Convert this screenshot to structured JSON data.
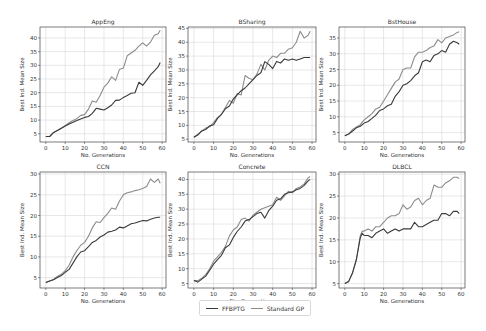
{
  "figure": {
    "legend": [
      {
        "label": "FFBPTG",
        "color": "#3a3a3a"
      },
      {
        "label": "Standard GP",
        "color": "#8c8c8c"
      }
    ]
  },
  "chart_data": [
    {
      "type": "line",
      "title": "AppEng",
      "xlabel": "No. Generations",
      "ylabel": "Best Ind. Mean Size",
      "xlim": [
        -3,
        62
      ],
      "ylim": [
        2,
        44
      ],
      "xticks": [
        0,
        10,
        20,
        30,
        40,
        50,
        60
      ],
      "yticks": [
        5,
        10,
        15,
        20,
        25,
        30,
        35,
        40
      ],
      "grid": true,
      "x": [
        0,
        2,
        4,
        6,
        8,
        10,
        12,
        14,
        16,
        18,
        20,
        22,
        24,
        26,
        28,
        30,
        32,
        34,
        36,
        38,
        40,
        42,
        44,
        46,
        48,
        50,
        52,
        54,
        56,
        58,
        59
      ],
      "series": [
        {
          "name": "FFBPTG",
          "values": [
            4,
            4,
            5.5,
            6.2,
            7,
            7.8,
            8.6,
            9.2,
            9.8,
            10.4,
            11,
            11.3,
            12.5,
            14.3,
            14,
            13.7,
            14.5,
            15.5,
            17.2,
            17.3,
            18.3,
            19,
            19.8,
            20,
            23.8,
            22.7,
            24.5,
            26.5,
            28,
            29.5,
            31
          ]
        },
        {
          "name": "Standard GP",
          "values": [
            4,
            4,
            5.5,
            6.2,
            7,
            8,
            9,
            9.8,
            10.5,
            11.7,
            12,
            14,
            17,
            16.5,
            19,
            22,
            23.5,
            25.8,
            24.5,
            28.5,
            29,
            33.5,
            34.5,
            35.5,
            37,
            38.2,
            37,
            38.5,
            41,
            41.5,
            42.8
          ]
        }
      ]
    },
    {
      "type": "line",
      "title": "BSharing",
      "xlabel": "No. Generations",
      "ylabel": "Best Ind. Mean Size",
      "xlim": [
        -3,
        62
      ],
      "ylim": [
        4,
        45.5
      ],
      "xticks": [
        0,
        10,
        20,
        30,
        40,
        50,
        60
      ],
      "yticks": [
        5,
        10,
        15,
        20,
        25,
        30,
        35,
        40,
        45
      ],
      "grid": true,
      "x": [
        0,
        2,
        4,
        6,
        8,
        10,
        12,
        14,
        16,
        18,
        20,
        22,
        24,
        26,
        28,
        30,
        32,
        34,
        36,
        38,
        40,
        42,
        44,
        46,
        48,
        50,
        52,
        54,
        56,
        58,
        59
      ],
      "series": [
        {
          "name": "FFBPTG",
          "values": [
            5.7,
            6.5,
            8,
            8.5,
            9.8,
            10.2,
            12.5,
            14,
            16,
            17,
            19.5,
            21,
            22.5,
            23.5,
            25,
            26.5,
            28,
            29,
            33,
            32,
            30.5,
            33,
            32.5,
            34,
            33.5,
            34,
            33.5,
            34,
            34.5,
            34.5,
            34.5
          ]
        },
        {
          "name": "Standard GP",
          "values": [
            5.7,
            6.8,
            8,
            9,
            9.5,
            11,
            12.8,
            14,
            16.5,
            19,
            18,
            21.5,
            21,
            28,
            27,
            26.5,
            28.5,
            32,
            30,
            33.5,
            35,
            34.5,
            36,
            36,
            37.5,
            38,
            40,
            44,
            41.5,
            42.5,
            44
          ]
        }
      ]
    },
    {
      "type": "line",
      "title": "BstHouse",
      "xlabel": "No. Generations",
      "ylabel": "Best Ind. Mean Size",
      "xlim": [
        -3,
        62
      ],
      "ylim": [
        2,
        38.5
      ],
      "xticks": [
        0,
        10,
        20,
        30,
        40,
        50,
        60
      ],
      "yticks": [
        5,
        10,
        15,
        20,
        25,
        30,
        35
      ],
      "grid": true,
      "x": [
        0,
        2,
        4,
        6,
        8,
        10,
        12,
        14,
        16,
        18,
        20,
        22,
        24,
        26,
        28,
        30,
        32,
        34,
        36,
        38,
        40,
        42,
        44,
        46,
        48,
        50,
        52,
        54,
        56,
        58,
        59
      ],
      "series": [
        {
          "name": "FFBPTG",
          "values": [
            4,
            4.5,
            5.5,
            6.5,
            7,
            8,
            8.5,
            9.5,
            10.5,
            12,
            12.5,
            13.5,
            14,
            16.5,
            18,
            20,
            20.5,
            21.5,
            23,
            24,
            27.5,
            28,
            27.5,
            29.5,
            30,
            31,
            30.5,
            33,
            34,
            33.5,
            33
          ]
        },
        {
          "name": "Standard GP",
          "values": [
            4,
            4.5,
            6,
            6.8,
            7.5,
            9,
            10,
            11,
            12.5,
            13,
            15,
            17,
            19,
            21,
            22,
            25,
            25.5,
            25.5,
            29,
            30.5,
            30.5,
            31,
            32,
            32.5,
            34.5,
            33.5,
            35,
            35.5,
            36,
            36.8,
            37
          ]
        }
      ]
    },
    {
      "type": "line",
      "title": "CCN",
      "xlabel": "No. Generations",
      "ylabel": "Best Ind. Mean Size",
      "xlim": [
        -3,
        62
      ],
      "ylim": [
        2.5,
        30.5
      ],
      "xticks": [
        0,
        10,
        20,
        30,
        40,
        50,
        60
      ],
      "yticks": [
        5,
        10,
        15,
        20,
        25,
        30
      ],
      "grid": true,
      "x": [
        0,
        2,
        4,
        6,
        8,
        10,
        12,
        14,
        16,
        18,
        20,
        22,
        24,
        26,
        28,
        30,
        32,
        34,
        36,
        38,
        40,
        42,
        44,
        46,
        48,
        50,
        52,
        54,
        56,
        58,
        59
      ],
      "series": [
        {
          "name": "FFBPTG",
          "values": [
            3.8,
            4.2,
            4.5,
            5,
            5.5,
            6.3,
            7,
            8.5,
            10,
            11.2,
            11.5,
            12.5,
            13.5,
            14,
            14.8,
            15.3,
            16,
            16.2,
            16.5,
            17.2,
            17,
            17.5,
            18,
            18.2,
            18.5,
            18.8,
            18.7,
            19.1,
            19.4,
            19.6,
            19.6
          ]
        },
        {
          "name": "Standard GP",
          "values": [
            3.8,
            4.2,
            4.6,
            5.3,
            5.8,
            6.7,
            8,
            10,
            11.5,
            12.8,
            13.5,
            15,
            17,
            18.5,
            18.3,
            19.5,
            20.5,
            21.8,
            21.5,
            23.5,
            25,
            25.5,
            25.7,
            26,
            26.2,
            26.5,
            27,
            28.8,
            28,
            28.8,
            27.8
          ]
        }
      ]
    },
    {
      "type": "line",
      "title": "Concrete",
      "xlabel": "No. Generations",
      "ylabel": "Best Ind. Mean Size",
      "xlim": [
        -3,
        62
      ],
      "ylim": [
        3.5,
        42.5
      ],
      "xticks": [
        0,
        10,
        20,
        30,
        40,
        50,
        60
      ],
      "yticks": [
        5,
        10,
        15,
        20,
        25,
        30,
        35,
        40
      ],
      "grid": true,
      "x": [
        0,
        2,
        4,
        6,
        8,
        10,
        12,
        14,
        16,
        18,
        20,
        22,
        24,
        26,
        28,
        30,
        32,
        34,
        36,
        38,
        40,
        42,
        44,
        46,
        48,
        50,
        52,
        54,
        56,
        58,
        59
      ],
      "series": [
        {
          "name": "FFBPTG",
          "values": [
            6,
            5.5,
            6.5,
            7.5,
            9.5,
            11.5,
            13,
            14.5,
            17,
            18,
            20.5,
            22.5,
            24,
            26,
            26.5,
            27.5,
            28.5,
            29,
            27,
            29.5,
            31,
            33,
            33.5,
            35,
            35.5,
            35.8,
            36.5,
            37,
            38,
            39.5,
            40
          ]
        },
        {
          "name": "Standard GP",
          "values": [
            6,
            6,
            6.8,
            8,
            10,
            12.5,
            14,
            15.5,
            17.5,
            21,
            23,
            24,
            26.5,
            27,
            26,
            28,
            29,
            30,
            30.5,
            31,
            31.5,
            34,
            33,
            34.5,
            36,
            35.5,
            37,
            37.5,
            38.5,
            40.5,
            41
          ]
        }
      ]
    },
    {
      "type": "line",
      "title": "DLBCL",
      "xlabel": "No. Generations",
      "ylabel": "Best Ind. Mean Size",
      "xlim": [
        -3,
        62
      ],
      "ylim": [
        4,
        30.5
      ],
      "xticks": [
        0,
        10,
        20,
        30,
        40,
        50,
        60
      ],
      "yticks": [
        5,
        10,
        15,
        20,
        25,
        30
      ],
      "grid": true,
      "x": [
        0,
        2,
        4,
        6,
        8,
        9,
        10,
        12,
        14,
        16,
        18,
        20,
        22,
        24,
        26,
        28,
        30,
        32,
        34,
        36,
        38,
        40,
        42,
        44,
        46,
        48,
        50,
        52,
        54,
        56,
        58,
        59
      ],
      "series": [
        {
          "name": "FFBPTG",
          "values": [
            5,
            5.5,
            7.5,
            10.5,
            15.5,
            16.5,
            16,
            16,
            15.5,
            16.5,
            17,
            17.5,
            16.5,
            17,
            17.5,
            17,
            17.5,
            17.5,
            17.5,
            19,
            18,
            18,
            18.5,
            19,
            19.5,
            19.5,
            21,
            21,
            20.5,
            21.5,
            21.5,
            21
          ]
        },
        {
          "name": "Standard GP",
          "values": [
            5,
            5.5,
            7.5,
            10.5,
            16,
            17,
            17,
            17.5,
            17,
            18,
            18,
            19,
            20,
            20.5,
            20.5,
            21,
            23,
            22,
            22.5,
            24,
            24.5,
            23,
            24,
            24.5,
            27.5,
            27,
            27,
            28,
            28.5,
            29.3,
            29.3,
            29
          ]
        }
      ]
    }
  ]
}
